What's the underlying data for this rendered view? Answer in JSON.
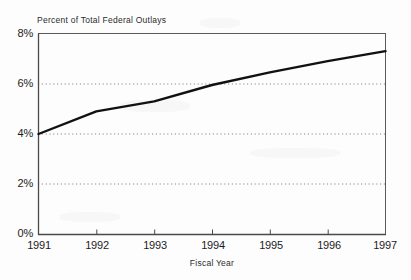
{
  "chart_data": {
    "type": "line",
    "title": "Percent of Total Federal Outlays",
    "xlabel": "Fiscal Year",
    "ylabel": "",
    "x": [
      1991,
      1992,
      1993,
      1994,
      1995,
      1996,
      1997
    ],
    "values": [
      4.0,
      4.9,
      5.3,
      5.95,
      6.45,
      6.9,
      7.3
    ],
    "series": [
      {
        "name": "Percent of Total Federal Outlays",
        "values": [
          4.0,
          4.9,
          5.3,
          5.95,
          6.45,
          6.9,
          7.3
        ]
      }
    ],
    "xtick_labels": [
      "1991",
      "1992",
      "1993",
      "1994",
      "1995",
      "1996",
      "1997"
    ],
    "ytick_labels": [
      "0%",
      "2%",
      "4%",
      "6%",
      "8%"
    ],
    "ytick_values": [
      0,
      2,
      4,
      6,
      8
    ],
    "ylim": [
      0,
      8
    ],
    "xlim": [
      1991,
      1997
    ],
    "grid": "horizontal-dotted",
    "legend": "none",
    "line_color": "#111111",
    "axis_color": "#555555",
    "grid_color": "#999999",
    "background_color": "#fdfdfd"
  },
  "axes": {
    "title_text": "Percent of Total Federal Outlays",
    "x_axis_title": "Fiscal Year"
  }
}
